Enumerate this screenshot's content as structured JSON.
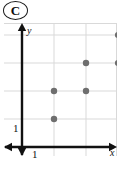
{
  "badge": {
    "letter": "C",
    "shape": "ellipse-outline"
  },
  "figure": {
    "axis_labels": {
      "x": "x",
      "y": "y"
    },
    "tick_labels": {
      "x": "1",
      "y": "1"
    },
    "colors": {
      "point": "#6e6e6e",
      "axis": "#111111",
      "grid": "#d9d9d9",
      "background": "#ffffff"
    }
  },
  "chart_data": {
    "type": "scatter",
    "title": "",
    "xlabel": "x",
    "ylabel": "y",
    "xlim": [
      0,
      3.6
    ],
    "ylim": [
      0,
      4.6
    ],
    "grid": true,
    "legend": false,
    "xticks": [
      1
    ],
    "yticks": [
      1
    ],
    "xticklabels": [
      "1"
    ],
    "yticklabels": [
      "1"
    ],
    "series": [
      {
        "name": "points",
        "marker": "circle",
        "color": "#6e6e6e",
        "x": [
          1,
          1,
          2,
          2,
          3,
          3
        ],
        "y": [
          1,
          2,
          2,
          3,
          3,
          4
        ]
      }
    ]
  }
}
